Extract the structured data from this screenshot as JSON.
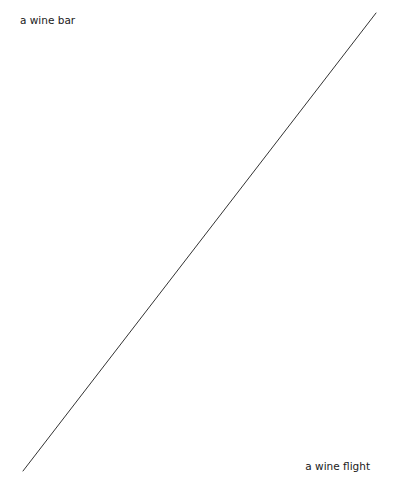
{
  "diagram": {
    "type": "scale-line",
    "start_label": "a wine bar",
    "end_label": "a wine flight",
    "line": {
      "x1": 376,
      "y1": 13,
      "x2": 23,
      "y2": 471,
      "color": "#333333",
      "width": 1
    }
  }
}
